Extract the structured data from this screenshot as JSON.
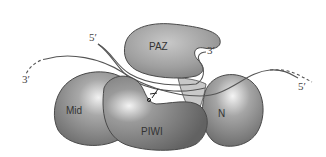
{
  "diagram": {
    "domains": [
      {
        "id": "paz",
        "label": "PAZ"
      },
      {
        "id": "mid",
        "label": "Mid"
      },
      {
        "id": "piwi",
        "label": "PIWI"
      },
      {
        "id": "n",
        "label": "N"
      }
    ],
    "strand_ends": {
      "guide_5prime": "5′",
      "guide_3prime": "3′",
      "target_3prime": "3′",
      "target_5prime": "5′"
    },
    "colors": {
      "domain_fill": "#8c8c8c",
      "domain_highlight": "#e6e6e6",
      "domain_outline": "#4a4a4a",
      "strand": "#555555",
      "linker_fill": "#c8c8c8"
    }
  }
}
